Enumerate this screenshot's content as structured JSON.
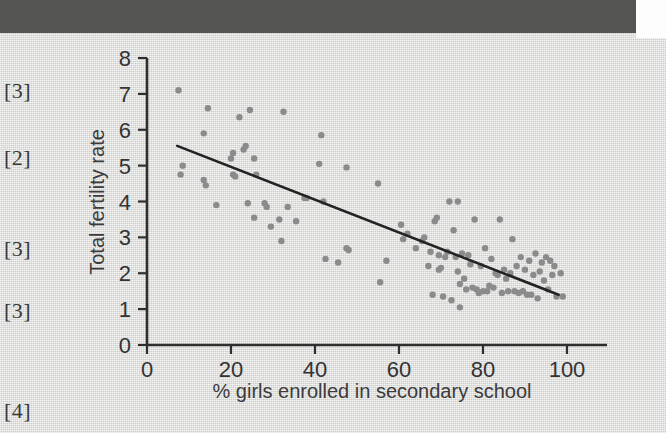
{
  "page": {
    "background_color": "#dcdcda",
    "topbar_color": "#555553"
  },
  "margin_marks": [
    {
      "label": "[3]",
      "top": 45
    },
    {
      "label": "[2]",
      "top": 112
    },
    {
      "label": "[3]",
      "top": 203
    },
    {
      "label": "[3]",
      "top": 265
    },
    {
      "label": "[4]",
      "top": 365
    }
  ],
  "chart_data": {
    "type": "scatter",
    "title": "",
    "xlabel": "% girls enrolled in secondary school",
    "ylabel": "Total fertility rate",
    "xlim": [
      0,
      110
    ],
    "ylim": [
      0,
      8
    ],
    "xticks": [
      0,
      20,
      40,
      60,
      80,
      100
    ],
    "xtick_labels": [
      "0",
      "20",
      "40",
      "60",
      "80",
      "100"
    ],
    "yticks": [
      0,
      1,
      2,
      3,
      4,
      5,
      6,
      7,
      8
    ],
    "ytick_labels": [
      "0",
      "1",
      "2",
      "3",
      "4",
      "5",
      "6",
      "7",
      "8"
    ],
    "grid": false,
    "legend": false,
    "point_color": "#8b8b8b",
    "point_radius": 3.2,
    "trendline": {
      "type": "line-of-best-fit",
      "color": "#232323",
      "x_start": 7.2,
      "y_start": 5.55,
      "x_end": 98.0,
      "y_end": 1.4
    },
    "series": [
      {
        "name": "Countries",
        "points": [
          [
            7.5,
            7.1
          ],
          [
            8.5,
            5.0
          ],
          [
            8.0,
            4.75
          ],
          [
            13.5,
            5.9
          ],
          [
            14.5,
            6.6
          ],
          [
            14.0,
            4.45
          ],
          [
            13.5,
            4.6
          ],
          [
            16.5,
            3.9
          ],
          [
            20.0,
            5.2
          ],
          [
            20.5,
            5.35
          ],
          [
            20.5,
            4.75
          ],
          [
            21.0,
            4.7
          ],
          [
            22.0,
            6.35
          ],
          [
            23.0,
            5.45
          ],
          [
            23.5,
            5.55
          ],
          [
            24.5,
            6.55
          ],
          [
            25.5,
            5.2
          ],
          [
            26.0,
            4.75
          ],
          [
            24.0,
            3.95
          ],
          [
            25.5,
            3.55
          ],
          [
            28.0,
            3.95
          ],
          [
            28.5,
            3.85
          ],
          [
            29.5,
            3.3
          ],
          [
            31.5,
            3.5
          ],
          [
            32.0,
            2.9
          ],
          [
            32.5,
            6.5
          ],
          [
            33.5,
            3.85
          ],
          [
            35.5,
            3.45
          ],
          [
            37.5,
            4.1
          ],
          [
            38.0,
            4.1
          ],
          [
            41.0,
            5.05
          ],
          [
            41.5,
            5.85
          ],
          [
            42.0,
            4.0
          ],
          [
            42.5,
            2.4
          ],
          [
            45.5,
            2.3
          ],
          [
            47.5,
            4.95
          ],
          [
            47.5,
            2.7
          ],
          [
            48.0,
            2.65
          ],
          [
            55.0,
            4.5
          ],
          [
            55.5,
            1.75
          ],
          [
            57.0,
            2.35
          ],
          [
            60.5,
            3.35
          ],
          [
            61.0,
            2.95
          ],
          [
            62.0,
            3.1
          ],
          [
            64.0,
            2.7
          ],
          [
            65.5,
            2.9
          ],
          [
            66.0,
            3.0
          ],
          [
            67.0,
            2.2
          ],
          [
            67.5,
            2.6
          ],
          [
            68.0,
            1.4
          ],
          [
            68.5,
            3.45
          ],
          [
            69.0,
            3.55
          ],
          [
            69.5,
            2.5
          ],
          [
            69.5,
            2.1
          ],
          [
            70.0,
            2.15
          ],
          [
            70.5,
            1.35
          ],
          [
            71.0,
            2.45
          ],
          [
            71.5,
            2.6
          ],
          [
            72.0,
            4.0
          ],
          [
            72.5,
            1.25
          ],
          [
            73.0,
            3.2
          ],
          [
            73.5,
            2.45
          ],
          [
            74.0,
            4.0
          ],
          [
            74.0,
            2.05
          ],
          [
            74.5,
            1.7
          ],
          [
            74.5,
            1.05
          ],
          [
            75.0,
            2.55
          ],
          [
            75.5,
            1.85
          ],
          [
            76.0,
            1.55
          ],
          [
            76.5,
            2.5
          ],
          [
            77.0,
            2.25
          ],
          [
            77.5,
            1.6
          ],
          [
            78.0,
            3.5
          ],
          [
            78.5,
            1.55
          ],
          [
            79.0,
            1.45
          ],
          [
            79.5,
            2.2
          ],
          [
            80.0,
            1.5
          ],
          [
            80.5,
            2.7
          ],
          [
            81.0,
            1.5
          ],
          [
            81.5,
            1.65
          ],
          [
            82.0,
            2.4
          ],
          [
            82.5,
            1.6
          ],
          [
            83.0,
            2.0
          ],
          [
            83.5,
            1.95
          ],
          [
            84.0,
            3.5
          ],
          [
            84.5,
            1.45
          ],
          [
            85.0,
            2.1
          ],
          [
            85.5,
            1.85
          ],
          [
            86.0,
            1.5
          ],
          [
            86.5,
            2.0
          ],
          [
            87.0,
            2.95
          ],
          [
            87.5,
            1.5
          ],
          [
            88.0,
            2.2
          ],
          [
            88.5,
            1.45
          ],
          [
            89.0,
            2.45
          ],
          [
            89.5,
            1.5
          ],
          [
            90.0,
            2.1
          ],
          [
            90.5,
            1.4
          ],
          [
            91.0,
            2.35
          ],
          [
            91.5,
            1.4
          ],
          [
            92.0,
            1.95
          ],
          [
            92.5,
            2.55
          ],
          [
            93.0,
            1.3
          ],
          [
            93.5,
            2.05
          ],
          [
            94.0,
            2.3
          ],
          [
            94.5,
            1.8
          ],
          [
            95.0,
            2.45
          ],
          [
            95.5,
            1.55
          ],
          [
            96.0,
            2.35
          ],
          [
            96.5,
            1.95
          ],
          [
            97.0,
            2.2
          ],
          [
            97.5,
            1.35
          ],
          [
            98.5,
            2.0
          ],
          [
            99.0,
            1.35
          ]
        ]
      }
    ]
  }
}
